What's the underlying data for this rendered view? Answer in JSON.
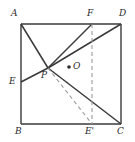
{
  "figure": {
    "type": "geometry-diagram",
    "shape": "square",
    "stroke_color": "#3a3a3a",
    "dash_color": "#8c8c8c",
    "background": "#ffffff",
    "canvas": {
      "width": 135,
      "height": 142
    }
  },
  "points": {
    "A": {
      "label": "A",
      "x": 21,
      "y": 24,
      "label_x": 11,
      "label_y": 9
    },
    "D": {
      "label": "D",
      "x": 121,
      "y": 24,
      "label_x": 119,
      "label_y": 9
    },
    "B": {
      "label": "B",
      "x": 21,
      "y": 124,
      "label_x": 15,
      "label_y": 127
    },
    "C": {
      "label": "C",
      "x": 121,
      "y": 124,
      "label_x": 117,
      "label_y": 127
    },
    "F": {
      "label": "F",
      "x": 92,
      "y": 24,
      "label_x": 87,
      "label_y": 9
    },
    "Eprime": {
      "label": "E'",
      "x": 92,
      "y": 124,
      "label_x": 85,
      "label_y": 127
    },
    "E": {
      "label": "E",
      "x": 21,
      "y": 82,
      "label_x": 9,
      "label_y": 77
    },
    "P": {
      "label": "P",
      "x": 48,
      "y": 68,
      "label_x": 41,
      "label_y": 71
    },
    "O": {
      "label": "O",
      "x": 69,
      "y": 68,
      "label_x": 73,
      "label_y": 63
    }
  },
  "segments": [
    {
      "name": "side-AD",
      "from": "A",
      "to": "D",
      "style": "solid"
    },
    {
      "name": "side-AB",
      "from": "A",
      "to": "B",
      "style": "solid"
    },
    {
      "name": "side-BC",
      "from": "B",
      "to": "C",
      "style": "solid"
    },
    {
      "name": "side-CD",
      "from": "C",
      "to": "D",
      "style": "solid"
    },
    {
      "name": "segment-A-P",
      "from": "A",
      "to": "P",
      "style": "solid"
    },
    {
      "name": "segment-P-C",
      "from": "P",
      "to": "C",
      "style": "solid"
    },
    {
      "name": "segment-E-P",
      "from": "E",
      "to": "P",
      "style": "solid"
    },
    {
      "name": "segment-P-D",
      "from": "P",
      "to": "D",
      "style": "solid"
    },
    {
      "name": "segment-P-F",
      "from": "P",
      "to": "F",
      "style": "solid"
    },
    {
      "name": "segment-F-Eprime",
      "from": "F",
      "to": "Eprime",
      "style": "dashed"
    },
    {
      "name": "segment-P-Eprime",
      "from": "P",
      "to": "Eprime",
      "style": "dashed"
    }
  ]
}
